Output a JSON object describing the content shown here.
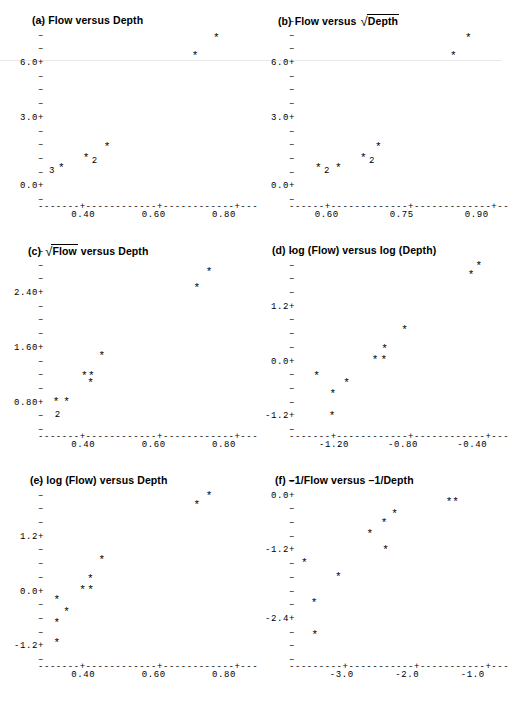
{
  "figure": {
    "background": "#ffffff",
    "ink": "#000000",
    "panel_count": 6
  },
  "panels": [
    {
      "id": "a",
      "label": "(a)",
      "title_plain": "(a) Flow versus Depth",
      "title_parts": [
        {
          "type": "text",
          "text": "(a) Flow versus Depth"
        }
      ],
      "chart_index": 0
    },
    {
      "id": "b",
      "label": "(b)",
      "title_plain": "(b) Flow versus √Depth",
      "title_parts": [
        {
          "type": "text",
          "text": "(b) Flow versus "
        },
        {
          "type": "radical",
          "text": "Depth"
        }
      ],
      "chart_index": 1
    },
    {
      "id": "c",
      "label": "(c)",
      "title_plain": "(c) √Flow versus Depth",
      "title_parts": [
        {
          "type": "text",
          "text": "(c) "
        },
        {
          "type": "radical",
          "text": "Flow"
        },
        {
          "type": "text",
          "text": " versus Depth"
        }
      ],
      "chart_index": 2
    },
    {
      "id": "d",
      "label": "(d)",
      "title_plain": "(d) log (Flow) versus log (Depth)",
      "title_parts": [
        {
          "type": "text",
          "text": "(d) log (Flow) versus log (Depth)"
        }
      ],
      "chart_index": 3
    },
    {
      "id": "e",
      "label": "(e)",
      "title_plain": "(e) log (Flow) versus Depth",
      "title_parts": [
        {
          "type": "text",
          "text": "(e) log (Flow) versus Depth"
        }
      ],
      "chart_index": 4
    },
    {
      "id": "f",
      "label": "(f)",
      "title_plain": "(f) –1/Flow versus –1/Depth",
      "title_parts": [
        {
          "type": "text",
          "text": "(f) –1/Flow versus –1/Depth"
        }
      ],
      "chart_index": 5
    }
  ],
  "chart_data": [
    {
      "type": "scatter",
      "title": "(a) Flow versus Depth",
      "xlabel": "Depth",
      "ylabel": "Flow",
      "xlim": [
        0.3,
        0.84
      ],
      "ylim": [
        -0.6,
        7.8
      ],
      "xticks": [
        0.4,
        0.6,
        0.8
      ],
      "xticklabels": [
        "0.40",
        "0.60",
        "0.80"
      ],
      "yticks": [
        0.0,
        3.0,
        6.0
      ],
      "yticklabels": [
        "0.0+",
        "3.0+",
        "6.0+"
      ],
      "y_minor_count": 13,
      "grid": false,
      "legend": null,
      "marker": "*",
      "points": [
        {
          "x": 0.34,
          "y": 0.6,
          "count": 3,
          "count_side": "left"
        },
        {
          "x": 0.41,
          "y": 1.1,
          "count": 2,
          "count_side": "right"
        },
        {
          "x": 0.47,
          "y": 1.6,
          "count": 1
        },
        {
          "x": 0.72,
          "y": 6.0,
          "count": 1
        },
        {
          "x": 0.78,
          "y": 6.9,
          "count": 1
        }
      ],
      "overplot_counts": [
        {
          "symbol": "3",
          "at_x": 0.34,
          "at_y": 0.6
        },
        {
          "symbol": "2",
          "at_x": 0.41,
          "at_y": 1.1
        }
      ]
    },
    {
      "type": "scatter",
      "title": "(b) Flow versus √Depth",
      "xlabel": "√Depth",
      "ylabel": "Flow",
      "xlim": [
        0.545,
        0.925
      ],
      "ylim": [
        -0.6,
        7.8
      ],
      "xticks": [
        0.6,
        0.75,
        0.9
      ],
      "xticklabels": [
        "0.60",
        "0.75",
        "0.90"
      ],
      "yticks": [
        0.0,
        3.0,
        6.0
      ],
      "yticklabels": [
        "0.0+",
        "3.0+",
        "6.0+"
      ],
      "y_minor_count": 13,
      "grid": false,
      "legend": null,
      "marker": "*",
      "points": [
        {
          "x": 0.585,
          "y": 0.6,
          "count": 2,
          "count_side": "right"
        },
        {
          "x": 0.625,
          "y": 0.6,
          "count": 1
        },
        {
          "x": 0.675,
          "y": 1.1,
          "count": 2,
          "count_side": "right"
        },
        {
          "x": 0.705,
          "y": 1.6,
          "count": 1
        },
        {
          "x": 0.855,
          "y": 6.0,
          "count": 1
        },
        {
          "x": 0.885,
          "y": 6.9,
          "count": 1
        }
      ],
      "overplot_counts": [
        {
          "symbol": "2",
          "at_x": 0.585,
          "at_y": 0.6
        },
        {
          "symbol": "2",
          "at_x": 0.675,
          "at_y": 1.1
        }
      ]
    },
    {
      "type": "scatter",
      "title": "(c) √Flow versus Depth",
      "xlabel": "Depth",
      "ylabel": "√Flow",
      "xlim": [
        0.3,
        0.84
      ],
      "ylim": [
        0.5,
        2.95
      ],
      "xticks": [
        0.4,
        0.6,
        0.8
      ],
      "xticklabels": [
        "0.40",
        "0.60",
        "0.80"
      ],
      "yticks": [
        0.8,
        1.6,
        2.4
      ],
      "yticklabels": [
        "0.80+",
        "1.60+",
        "2.40+"
      ],
      "y_minor_count": 13,
      "grid": false,
      "legend": null,
      "marker": "*",
      "points": [
        {
          "x": 0.325,
          "y": 0.8,
          "count": 2,
          "count_side": "below"
        },
        {
          "x": 0.355,
          "y": 0.8,
          "count": 1
        },
        {
          "x": 0.405,
          "y": 1.16,
          "count": 1
        },
        {
          "x": 0.425,
          "y": 1.16,
          "count": 1
        },
        {
          "x": 0.423,
          "y": 1.06,
          "count": 1
        },
        {
          "x": 0.455,
          "y": 1.45,
          "count": 1
        },
        {
          "x": 0.725,
          "y": 2.4,
          "count": 1
        },
        {
          "x": 0.76,
          "y": 2.62,
          "count": 1
        }
      ],
      "overplot_counts": [
        {
          "symbol": "2",
          "at_x": 0.325,
          "at_y": 0.8
        }
      ]
    },
    {
      "type": "scatter",
      "title": "(d) log (Flow) versus log (Depth)",
      "xlabel": "log (Depth)",
      "ylabel": "log (Flow)",
      "xlim": [
        -1.4,
        -0.3
      ],
      "ylim": [
        -1.35,
        2.35
      ],
      "xticks": [
        -1.2,
        -0.8,
        -0.4
      ],
      "xticklabels": [
        "-1.20",
        "-0.80",
        "-0.40"
      ],
      "yticks": [
        -1.2,
        0.0,
        1.2
      ],
      "yticklabels": [
        "-1.2+",
        "0.0+",
        "1.2+"
      ],
      "y_minor_count": 13,
      "grid": false,
      "legend": null,
      "marker": "*",
      "points": [
        {
          "x": -1.205,
          "y": -1.2,
          "count": 1
        },
        {
          "x": -1.2,
          "y": -0.74,
          "count": 1
        },
        {
          "x": -1.295,
          "y": -0.34,
          "count": 1
        },
        {
          "x": -1.12,
          "y": -0.49,
          "count": 1
        },
        {
          "x": -0.955,
          "y": 0.0,
          "count": 1
        },
        {
          "x": -0.905,
          "y": 0.0,
          "count": 1
        },
        {
          "x": -0.9,
          "y": 0.22,
          "count": 1
        },
        {
          "x": -0.785,
          "y": 0.62,
          "count": 1
        },
        {
          "x": -0.4,
          "y": 1.8,
          "count": 1
        },
        {
          "x": -0.355,
          "y": 1.98,
          "count": 1
        }
      ],
      "overplot_counts": []
    },
    {
      "type": "scatter",
      "title": "(e) log (Flow) versus Depth",
      "xlabel": "Depth",
      "ylabel": "log (Flow)",
      "xlim": [
        0.3,
        0.84
      ],
      "ylim": [
        -1.35,
        2.35
      ],
      "xticks": [
        0.4,
        0.6,
        0.8
      ],
      "xticklabels": [
        "0.40",
        "0.60",
        "0.80"
      ],
      "yticks": [
        -1.2,
        0.0,
        1.2
      ],
      "yticklabels": [
        "-1.2+",
        "0.0+",
        "1.2+"
      ],
      "y_minor_count": 13,
      "grid": false,
      "legend": null,
      "marker": "*",
      "points": [
        {
          "x": 0.327,
          "y": -1.14,
          "count": 1
        },
        {
          "x": 0.327,
          "y": -0.72,
          "count": 1
        },
        {
          "x": 0.327,
          "y": -0.22,
          "count": 1
        },
        {
          "x": 0.355,
          "y": -0.47,
          "count": 1
        },
        {
          "x": 0.4,
          "y": 0.0,
          "count": 1
        },
        {
          "x": 0.423,
          "y": 0.0,
          "count": 1
        },
        {
          "x": 0.422,
          "y": 0.22,
          "count": 1
        },
        {
          "x": 0.455,
          "y": 0.62,
          "count": 1
        },
        {
          "x": 0.725,
          "y": 1.8,
          "count": 1
        },
        {
          "x": 0.76,
          "y": 1.98,
          "count": 1
        }
      ],
      "overplot_counts": []
    },
    {
      "type": "scatter",
      "title": "(f) –1/Flow versus –1/Depth",
      "xlabel": "–1/Depth",
      "ylabel": "–1/Flow",
      "xlim": [
        -3.65,
        -0.75
      ],
      "ylim": [
        -3.25,
        0.3
      ],
      "xticks": [
        -3.0,
        -2.0,
        -1.0
      ],
      "xticklabels": [
        "-3.0",
        "-2.0",
        "-1.0"
      ],
      "yticks": [
        -2.4,
        -1.2,
        0.0
      ],
      "yticklabels": [
        "-2.4+",
        "-1.2+",
        "0.0+"
      ],
      "y_minor_count": 13,
      "grid": false,
      "legend": null,
      "marker": "*",
      "points": [
        {
          "x": -3.4,
          "y": -2.88,
          "count": 1
        },
        {
          "x": -3.41,
          "y": -2.22,
          "count": 1
        },
        {
          "x": -3.56,
          "y": -1.42,
          "count": 1
        },
        {
          "x": -3.04,
          "y": -1.7,
          "count": 1
        },
        {
          "x": -2.32,
          "y": -1.15,
          "count": 1
        },
        {
          "x": -2.56,
          "y": -0.83,
          "count": 1
        },
        {
          "x": -2.34,
          "y": -0.6,
          "count": 1
        },
        {
          "x": -2.18,
          "y": -0.42,
          "count": 1
        },
        {
          "x": -1.35,
          "y": -0.16,
          "count": 1
        },
        {
          "x": -1.25,
          "y": -0.16,
          "count": 1
        }
      ],
      "overplot_counts": []
    }
  ]
}
